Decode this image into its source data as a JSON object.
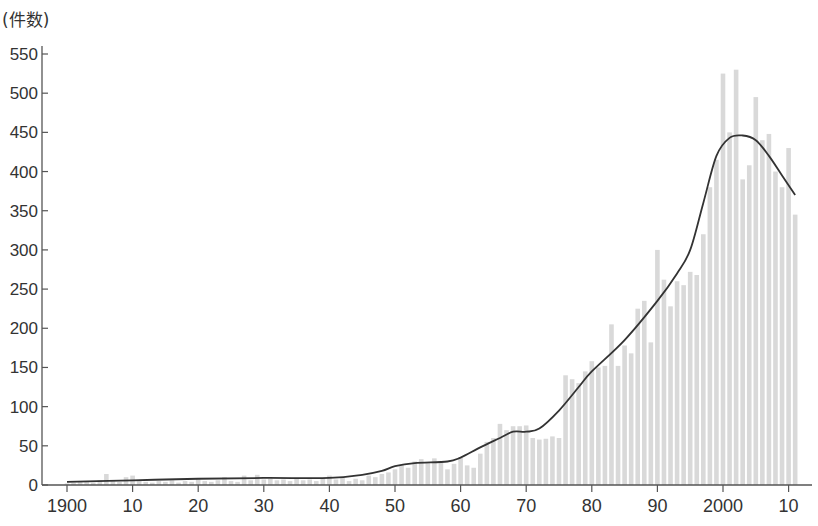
{
  "chart_data": {
    "type": "bar",
    "title": "",
    "ylabel": "(件数)",
    "xlabel": "",
    "ylim": [
      0,
      550
    ],
    "yticks": [
      0,
      50,
      100,
      150,
      200,
      250,
      300,
      350,
      400,
      450,
      500,
      550
    ],
    "xticks": [
      {
        "year": 1900,
        "label": "1900"
      },
      {
        "year": 1910,
        "label": "10"
      },
      {
        "year": 1920,
        "label": "20"
      },
      {
        "year": 1930,
        "label": "30"
      },
      {
        "year": 1940,
        "label": "40"
      },
      {
        "year": 1950,
        "label": "50"
      },
      {
        "year": 1960,
        "label": "60"
      },
      {
        "year": 1970,
        "label": "70"
      },
      {
        "year": 1980,
        "label": "80"
      },
      {
        "year": 1990,
        "label": "90"
      },
      {
        "year": 2000,
        "label": "2000"
      },
      {
        "year": 2010,
        "label": "10"
      }
    ],
    "grid": false,
    "legend": null,
    "x_start": 1900,
    "x_end": 2011,
    "series": [
      {
        "name": "annual count",
        "kind": "bar",
        "color": "#d9d9d9",
        "values": [
          2,
          3,
          5,
          4,
          3,
          6,
          14,
          5,
          4,
          10,
          12,
          5,
          4,
          3,
          5,
          4,
          6,
          3,
          5,
          4,
          8,
          5,
          4,
          6,
          10,
          5,
          4,
          12,
          6,
          13,
          7,
          8,
          6,
          7,
          5,
          8,
          6,
          7,
          5,
          9,
          12,
          7,
          9,
          5,
          8,
          6,
          12,
          10,
          14,
          16,
          20,
          25,
          22,
          30,
          33,
          28,
          34,
          30,
          20,
          27,
          35,
          25,
          22,
          40,
          55,
          60,
          78,
          70,
          75,
          75,
          76,
          60,
          58,
          59,
          62,
          60,
          140,
          135,
          130,
          145,
          158,
          150,
          152,
          205,
          152,
          178,
          168,
          225,
          235,
          182,
          300,
          262,
          228,
          260,
          255,
          272,
          268,
          320,
          380,
          415,
          525,
          450,
          530,
          390,
          408,
          495,
          440,
          448,
          400,
          380,
          430,
          345
        ]
      },
      {
        "name": "trend",
        "kind": "line",
        "color": "#333333",
        "points": [
          [
            1900,
            4
          ],
          [
            1910,
            6
          ],
          [
            1920,
            8
          ],
          [
            1930,
            9
          ],
          [
            1940,
            9
          ],
          [
            1945,
            13
          ],
          [
            1948,
            18
          ],
          [
            1950,
            24
          ],
          [
            1953,
            28
          ],
          [
            1958,
            30
          ],
          [
            1960,
            35
          ],
          [
            1963,
            48
          ],
          [
            1966,
            60
          ],
          [
            1968,
            68
          ],
          [
            1970,
            68
          ],
          [
            1972,
            72
          ],
          [
            1975,
            95
          ],
          [
            1978,
            125
          ],
          [
            1980,
            145
          ],
          [
            1985,
            185
          ],
          [
            1990,
            235
          ],
          [
            1993,
            270
          ],
          [
            1995,
            300
          ],
          [
            1997,
            360
          ],
          [
            1999,
            420
          ],
          [
            2001,
            443
          ],
          [
            2003,
            446
          ],
          [
            2005,
            440
          ],
          [
            2007,
            420
          ],
          [
            2009,
            395
          ],
          [
            2011,
            370
          ]
        ]
      }
    ]
  }
}
